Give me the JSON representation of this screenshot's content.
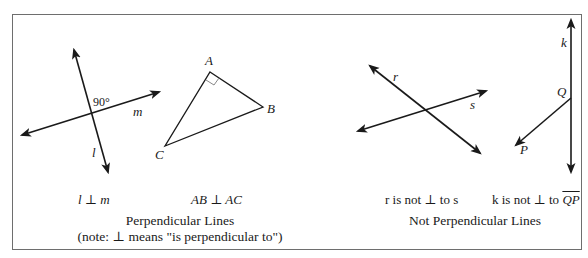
{
  "figure": {
    "top_cutoff_text": [
      "'",
      "'"
    ],
    "perpendicular": {
      "lines_example": {
        "line1_label": "l",
        "line2_label": "m",
        "angle_label": "90°",
        "statement": "l ⊥ m"
      },
      "triangle_example": {
        "vertices": [
          "A",
          "B",
          "C"
        ],
        "right_angle_at": "A",
        "statement": "AB ⊥ AC"
      },
      "caption": "Perpendicular Lines",
      "note": "(note: ⊥ means \"is perpendicular to\")"
    },
    "not_perpendicular": {
      "lines_example": {
        "line1_label": "r",
        "line2_label": "s",
        "statement": "r is not ⊥ to s"
      },
      "ray_example": {
        "line_label": "k",
        "point_q": "Q",
        "point_p": "P",
        "statement_prefix": "k is not ⊥ to ",
        "statement_ray": "QP"
      },
      "caption": "Not Perpendicular Lines"
    }
  },
  "colors": {
    "ink": "#1a1a1a",
    "frame": "#6e6e6e",
    "background": "#ffffff"
  }
}
